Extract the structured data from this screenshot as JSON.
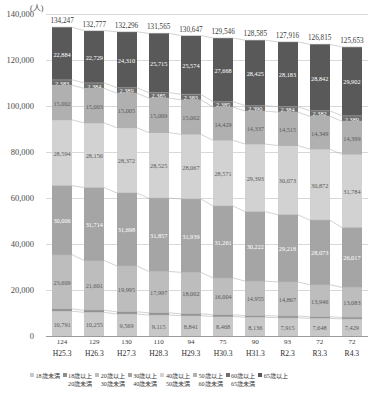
{
  "axis": {
    "unit": "(人)",
    "yticks": [
      "140,000",
      "120,000",
      "100,000",
      "80,000",
      "60,000",
      "40,000",
      "20,000",
      "0"
    ],
    "ymax": 140000,
    "ymin": 0
  },
  "chart_data": {
    "type": "bar",
    "stacked": true,
    "title": "",
    "xlabel": "",
    "ylabel": "(人)",
    "ylim": [
      0,
      140000
    ],
    "grid": true,
    "legend_position": "bottom",
    "categories": [
      "H25.3",
      "H26.3",
      "H27.3",
      "H28.3",
      "H29.3",
      "H30.3",
      "H31.3",
      "R2.3",
      "R3.3",
      "R4.3"
    ],
    "totals": [
      134247,
      132777,
      132296,
      131565,
      130647,
      129546,
      128585,
      127916,
      126815,
      125653
    ],
    "sub_counts": [
      124,
      129,
      130,
      110,
      94,
      75,
      90,
      93,
      72,
      72
    ],
    "series": [
      {
        "name": "18歳未満",
        "color": "#c8c8c8",
        "values": [
          10791,
          10255,
          9569,
          9115,
          8841,
          8468,
          8136,
          7915,
          7648,
          7429
        ],
        "labels": [
          "10,791",
          "10,255",
          "9,569",
          "9,115",
          "8,841",
          "8,468",
          "8,136",
          "7,915",
          "7,648",
          "7,429"
        ]
      },
      {
        "name": "18歳以上20歳未満",
        "color": "#8e8e8e",
        "values": [
          978,
          935,
          958,
          962,
          839,
          760,
          727,
          761,
          703,
          650
        ],
        "labels": [
          "978",
          "935",
          "958",
          "962",
          "839",
          "760",
          "727",
          "761",
          "703",
          "650"
        ]
      },
      {
        "name": "20歳以上30歳未満",
        "color": "#bdbdbd",
        "values": [
          23609,
          21601,
          19995,
          17997,
          18002,
          16004,
          14955,
          14867,
          13946,
          13083
        ],
        "labels": [
          "23,609",
          "21,601",
          "19,995",
          "17,997",
          "18,002",
          "16,004",
          "14,955",
          "14,867",
          "13,946",
          "13,083"
        ]
      },
      {
        "name": "30歳以上40歳未満",
        "color": "#a5a5a5",
        "values": [
          30006,
          31714,
          31698,
          31857,
          31939,
          31261,
          30222,
          29218,
          28073,
          26017
        ],
        "labels": [
          "30,006",
          "31,714",
          "31,698",
          "31,857",
          "31,939",
          "31,261",
          "30,222",
          "29,218",
          "28,073",
          "26,017"
        ]
      },
      {
        "name": "40歳以上50歳未満",
        "color": "#d2d2d2",
        "values": [
          28594,
          28156,
          28372,
          28525,
          28067,
          28571,
          29393,
          30073,
          30872,
          31784
        ],
        "labels": [
          "28,594",
          "28,156",
          "28,372",
          "28,525",
          "28,067",
          "28,571",
          "29,393",
          "30,073",
          "30,872",
          "31,784"
        ]
      },
      {
        "name": "50歳以上60歳未満",
        "color": "#b0b0b0",
        "values": [
          15002,
          15003,
          15005,
          15009,
          15002,
          14429,
          14337,
          14515,
          14349,
          14399
        ],
        "labels": [
          "15,002",
          "15,003",
          "15,005",
          "15,009",
          "15,002",
          "14,429",
          "14,337",
          "14,515",
          "14,349",
          "14,399"
        ]
      },
      {
        "name": "60歳以上65歳未満",
        "color": "#6e6e6e",
        "values": [
          2383,
          2384,
          2389,
          2385,
          2383,
          2385,
          2390,
          2384,
          2382,
          2389
        ],
        "labels": [
          "2,383",
          "2,384",
          "2,389",
          "2,385",
          "2,383",
          "2,385",
          "2,390",
          "2,384",
          "2,382",
          "2,389"
        ]
      },
      {
        "name": "65歳以上",
        "color": "#595959",
        "values": [
          22884,
          22729,
          24310,
          25715,
          25574,
          27668,
          28425,
          28183,
          28842,
          29902
        ],
        "labels": [
          "22,884",
          "22,729",
          "24,310",
          "25,715",
          "25,574",
          "27,668",
          "28,425",
          "28,183",
          "28,842",
          "29,902"
        ]
      }
    ],
    "total_labels": [
      "134,247",
      "132,777",
      "132,296",
      "131,565",
      "130,647",
      "129,546",
      "128,585",
      "127,916",
      "126,815",
      "125,653"
    ],
    "sub_count_labels": [
      "124",
      "129",
      "130",
      "110",
      "94",
      "75",
      "90",
      "93",
      "72",
      "72"
    ]
  },
  "legend": {
    "items": [
      {
        "label_top": "18歳未満",
        "label_bottom": ""
      },
      {
        "label_top": "18歳以上",
        "label_bottom": "20歳未満"
      },
      {
        "label_top": "20歳以上",
        "label_bottom": "30歳未満"
      },
      {
        "label_top": "30歳以上",
        "label_bottom": "40歳未満"
      },
      {
        "label_top": "40歳以上",
        "label_bottom": "50歳未満"
      },
      {
        "label_top": "50歳以上",
        "label_bottom": "60歳未満"
      },
      {
        "label_top": "60歳以上",
        "label_bottom": "65歳未満"
      },
      {
        "label_top": "65歳以上",
        "label_bottom": ""
      }
    ]
  }
}
